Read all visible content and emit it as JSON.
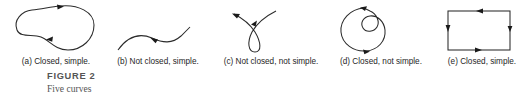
{
  "figure": {
    "title": "FIGURE 2",
    "subtitle": "Five curves",
    "stroke_color": "#2b2b2b",
    "caption_color": "#555555",
    "background": "#ffffff"
  },
  "curves": [
    {
      "key": "a",
      "label": "(a) Closed, simple.",
      "shape": "closed-peanut-blob",
      "closed": true,
      "simple": true,
      "arrow_count": 2
    },
    {
      "key": "b",
      "label": "(b) Not closed, simple.",
      "shape": "open-s-curve",
      "closed": false,
      "simple": true,
      "arrow_count": 1
    },
    {
      "key": "c",
      "label": "(c) Not closed, not simple.",
      "shape": "open-loop-with-crossing",
      "closed": false,
      "simple": false,
      "arrow_count": 2
    },
    {
      "key": "d",
      "label": "(d) Closed, not simple.",
      "shape": "closed-spiral-inner-loop",
      "closed": true,
      "simple": false,
      "arrow_count": 2
    },
    {
      "key": "e",
      "label": "(e) Closed, simple.",
      "shape": "closed-rectangle",
      "closed": true,
      "simple": true,
      "arrow_count": 4
    }
  ]
}
